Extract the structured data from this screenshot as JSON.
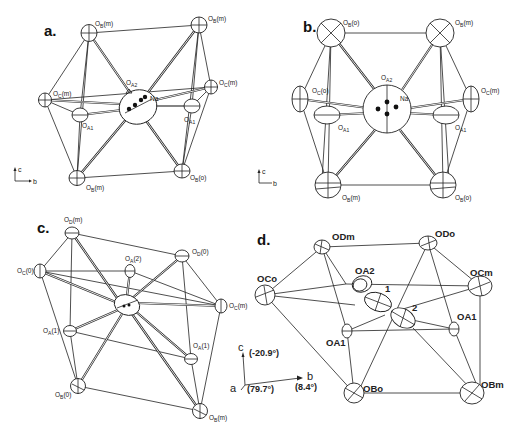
{
  "figure": {
    "panels": [
      {
        "id": "a",
        "label": "a.",
        "atoms": [
          {
            "name": "OB(m)",
            "label": "O_B(m)",
            "sub": "B",
            "suffix": "(m)"
          },
          {
            "name": "OB(m)-top-right",
            "label": "O_B(m)",
            "sub": "B",
            "suffix": "(m)"
          },
          {
            "name": "OC(m)-left",
            "label": "O_C(m)",
            "sub": "C",
            "suffix": "(m)"
          },
          {
            "name": "OC(m)-right",
            "label": "O_C(m)",
            "sub": "C",
            "suffix": "(m)"
          },
          {
            "name": "OA1-left",
            "label": "O_A1",
            "sub": "A1",
            "suffix": ""
          },
          {
            "name": "OA1-right",
            "label": "O_A1",
            "sub": "A1",
            "suffix": ""
          },
          {
            "name": "OA2",
            "label": "O_A2",
            "sub": "A2",
            "suffix": ""
          },
          {
            "name": "OB(m)-bottom-left",
            "label": "O_B(m)",
            "sub": "B",
            "suffix": "(m)"
          },
          {
            "name": "OB(o)-bottom-right",
            "label": "O_B(o)",
            "sub": "B",
            "suffix": "(o)"
          },
          {
            "name": "Na",
            "label": "Na",
            "sub": "",
            "suffix": ""
          }
        ],
        "axes": {
          "up": "c",
          "right": "b"
        }
      },
      {
        "id": "b",
        "label": "b.",
        "atoms": [
          {
            "name": "OB(o)-top-left",
            "label": "O_B(o)"
          },
          {
            "name": "OB(m)-top-right",
            "label": "O_B(m)"
          },
          {
            "name": "OC(o)-left",
            "label": "O_C(o)"
          },
          {
            "name": "OC(m)-right",
            "label": "O_C(m)"
          },
          {
            "name": "OA1-left",
            "label": "O_A1"
          },
          {
            "name": "OA1-right",
            "label": "O_A1"
          },
          {
            "name": "OA2",
            "label": "O_A2"
          },
          {
            "name": "OB(m)-bottom-left",
            "label": "O_B(m)"
          },
          {
            "name": "OB(o)-bottom-right",
            "label": "O_B(o)"
          },
          {
            "name": "Na",
            "label": "Na"
          }
        ],
        "axes": {
          "up": "c",
          "right": "b"
        }
      },
      {
        "id": "c",
        "label": "c.",
        "atoms": [
          {
            "name": "OD(m)",
            "label": "O_D(m)"
          },
          {
            "name": "OD(0)",
            "label": "O_D(0)"
          },
          {
            "name": "OC(0)",
            "label": "O_C(0)"
          },
          {
            "name": "OC(m)",
            "label": "O_C(m)"
          },
          {
            "name": "OA(2)",
            "label": "O_A(2)"
          },
          {
            "name": "OA(1)-left",
            "label": "O_A(1)"
          },
          {
            "name": "OA(1)-right",
            "label": "O_A(1)"
          },
          {
            "name": "OB(0)",
            "label": "O_B(0)"
          },
          {
            "name": "OB(m)",
            "label": "O_B(m)"
          }
        ]
      },
      {
        "id": "d",
        "label": "d.",
        "atoms": [
          {
            "name": "ODm",
            "label": "ODm"
          },
          {
            "name": "ODo",
            "label": "ODo"
          },
          {
            "name": "OCo",
            "label": "OCo"
          },
          {
            "name": "OCm",
            "label": "OCm"
          },
          {
            "name": "OA2",
            "label": "OA2"
          },
          {
            "name": "OA1-left",
            "label": "OA1"
          },
          {
            "name": "OA1-right",
            "label": "OA1"
          },
          {
            "name": "OBo",
            "label": "OBo"
          },
          {
            "name": "OBm",
            "label": "OBm"
          },
          {
            "name": "site-1",
            "label": "1"
          },
          {
            "name": "site-2",
            "label": "2"
          }
        ],
        "axes": {
          "c": "c",
          "c_angle": "(-20.9°)",
          "a": "a",
          "a_angle": "(79.7°)",
          "b": "b",
          "b_angle": "(8.4°)"
        }
      }
    ]
  }
}
